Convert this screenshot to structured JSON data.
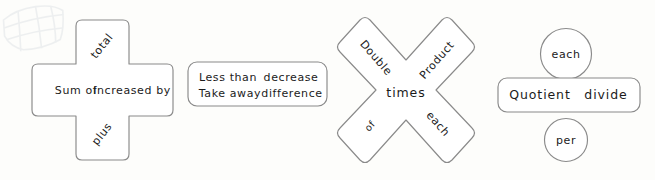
{
  "page": {
    "background_color": "#fdfdfb",
    "stroke_color": "#8a8a8a",
    "text_color": "#1b1b1b",
    "shape_fill": "#ffffff"
  },
  "watermark": {
    "name": "faint-grid-net-graphic",
    "visible": true
  },
  "groups": [
    {
      "id": "addition",
      "shape": "plus-cross",
      "words": {
        "top": "total",
        "left": "Sum of",
        "right": "Increased by",
        "bottom": "plus"
      }
    },
    {
      "id": "subtraction",
      "shape": "rounded-rectangle",
      "words": {
        "row1_left": "Less than",
        "row1_right": "decrease",
        "row2_left": "Take away",
        "row2_right": "difference"
      }
    },
    {
      "id": "multiplication",
      "shape": "x-cross",
      "words": {
        "top_left": "Double",
        "top_right": "Product",
        "center": "times",
        "bottom_left": "of",
        "bottom_right": "each"
      }
    },
    {
      "id": "division",
      "shape": "circle-rect-circle",
      "words": {
        "top_circle": "each",
        "rect_left": "Quotient",
        "rect_right": "divide",
        "bottom_circle": "per"
      }
    }
  ]
}
